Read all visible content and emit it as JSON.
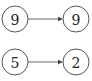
{
  "diagram": {
    "type": "node-link",
    "nodes": [
      {
        "id": "n1",
        "label": "9",
        "cx": 15,
        "cy": 19
      },
      {
        "id": "n2",
        "label": "9",
        "cx": 76,
        "cy": 19
      },
      {
        "id": "n3",
        "label": "5",
        "cx": 15,
        "cy": 62
      },
      {
        "id": "n4",
        "label": "2",
        "cx": 76,
        "cy": 62
      }
    ],
    "edges": [
      {
        "from": "n1",
        "to": "n2",
        "directed": true
      },
      {
        "from": "n3",
        "to": "n4",
        "directed": true
      }
    ],
    "colors": {
      "stroke": "#444444",
      "background": "#ffffff",
      "text": "#222222"
    }
  }
}
